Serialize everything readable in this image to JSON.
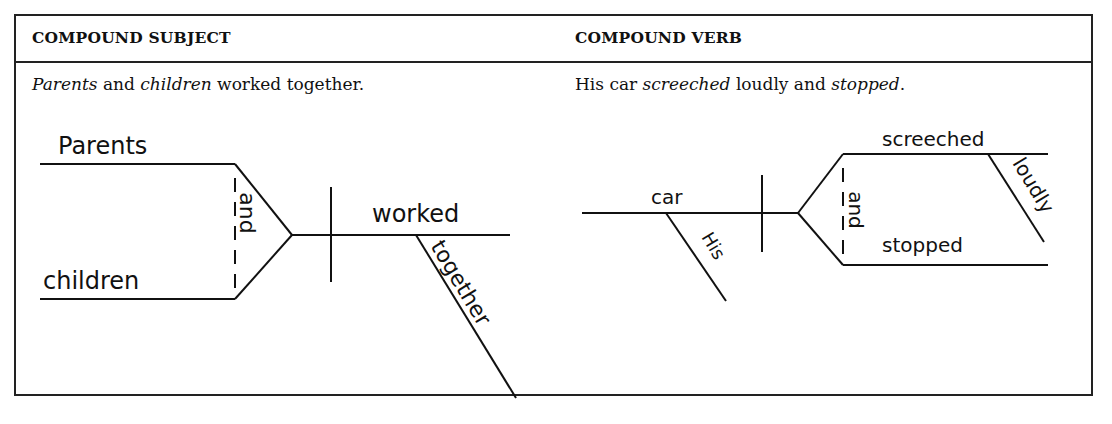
{
  "columns": [
    {
      "header": "COMPOUND SUBJECT",
      "sentence": {
        "parts": [
          {
            "text": "Parents",
            "italic": true
          },
          {
            "text": " and ",
            "italic": false
          },
          {
            "text": "children",
            "italic": true
          },
          {
            "text": " worked together.",
            "italic": false
          }
        ]
      },
      "diagram": {
        "subject_top": "Parents",
        "subject_bottom": "children",
        "conjunction": "and",
        "verb": "worked",
        "modifier": "together"
      }
    },
    {
      "header": "COMPOUND VERB",
      "sentence": {
        "parts": [
          {
            "text": "His car ",
            "italic": false
          },
          {
            "text": "screeched",
            "italic": true
          },
          {
            "text": " loudly and ",
            "italic": false
          },
          {
            "text": "stopped",
            "italic": true
          },
          {
            "text": ".",
            "italic": false
          }
        ]
      },
      "diagram": {
        "subject": "car",
        "subject_modifier": "His",
        "verb_top": "screeched",
        "verb_top_modifier": "loudly",
        "conjunction": "and",
        "verb_bottom": "stopped"
      }
    }
  ]
}
